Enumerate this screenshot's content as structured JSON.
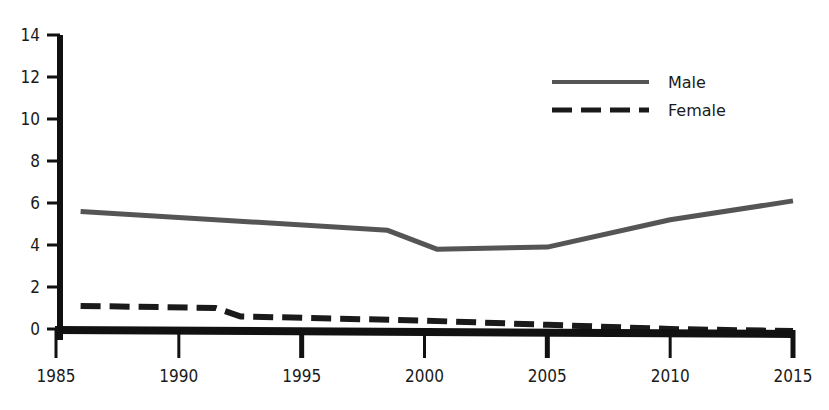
{
  "chart_data": {
    "type": "line",
    "title": "",
    "xlabel": "",
    "ylabel": "",
    "xlim": [
      1985,
      2015
    ],
    "ylim": [
      0,
      14
    ],
    "x_ticks": [
      "1985",
      "1990",
      "1995",
      "2000",
      "2005",
      "2010",
      "2015"
    ],
    "y_ticks": [
      "0",
      "2",
      "4",
      "6",
      "8",
      "10",
      "12",
      "14"
    ],
    "grid": false,
    "legend_position": "upper right",
    "series": [
      {
        "name": "Male",
        "style": "solid",
        "color": "#555555",
        "x": [
          1986,
          1998.5,
          2000.5,
          2005,
          2010,
          2015
        ],
        "y": [
          5.6,
          4.7,
          3.8,
          3.9,
          5.2,
          6.1
        ]
      },
      {
        "name": "Female",
        "style": "dashed",
        "color": "#1a1a1a",
        "x": [
          1986,
          1991.5,
          1992.5,
          2000,
          2005,
          2010,
          2015
        ],
        "y": [
          1.1,
          1.0,
          0.6,
          0.4,
          0.2,
          0.0,
          -0.1
        ]
      }
    ]
  },
  "legend": {
    "male_label": "Male",
    "female_label": "Female"
  }
}
